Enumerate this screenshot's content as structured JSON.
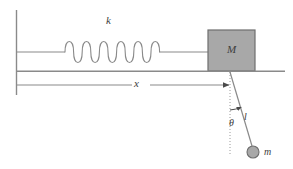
{
  "figure": {
    "type": "physics-diagram",
    "labels": {
      "spring_constant": "k",
      "block_mass": "M",
      "displacement": "x",
      "angle": "θ",
      "pendulum_length": "l",
      "bob_mass": "m"
    },
    "colors": {
      "line": "#808080",
      "dark_line": "#4a4a4a",
      "block_fill": "#a8a8a8",
      "block_stroke": "#6e6e6e",
      "bob_fill": "#a8a8a8",
      "bob_stroke": "#6e6e6e",
      "text": "#3d3d3d",
      "background": "#ffffff"
    },
    "geometry": {
      "wall_x": 16,
      "wall_top_y": 10,
      "wall_bottom_y": 95,
      "spring_axis_y": 52,
      "spring_start_x": 65,
      "spring_end_x": 160,
      "spring_coils": 11,
      "spring_amplitude": 12,
      "block_left": 208,
      "block_top": 30,
      "block_right": 255,
      "block_bottom": 71,
      "ground_y": 71,
      "ground_right_x": 285,
      "dimension_arrow_y": 85,
      "dimension_arrow_start_x": 16,
      "dimension_arrow_end_x": 230,
      "pivot_x": 230,
      "pivot_y": 72,
      "bob_x": 253,
      "bob_y": 152,
      "bob_radius": 6,
      "plumb_bottom_y": 156,
      "angle_arc_radius": 38
    }
  }
}
